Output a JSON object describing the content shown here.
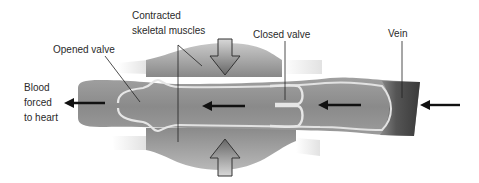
{
  "diagram": {
    "labels": {
      "contracted_muscles_line1": "Contracted",
      "contracted_muscles_line2": "skeletal muscles",
      "opened_valve": "Opened valve",
      "closed_valve": "Closed valve",
      "vein": "Vein",
      "blood_line1": "Blood",
      "blood_line2": "forced",
      "blood_line3": "to heart"
    },
    "colors": {
      "muscle_light": "#c4c4c4",
      "muscle_dark": "#7a7a7a",
      "vein_wall": "#8e8e8e",
      "vein_lumen": "#9a9a9a",
      "valve_outline": "#e4e4e4",
      "vein_end_dark": "#3e3e3e",
      "tendon": "#efefef",
      "arrow": "#111111",
      "label_text": "#2a2a2a"
    },
    "flow_direction": "right-to-left"
  }
}
